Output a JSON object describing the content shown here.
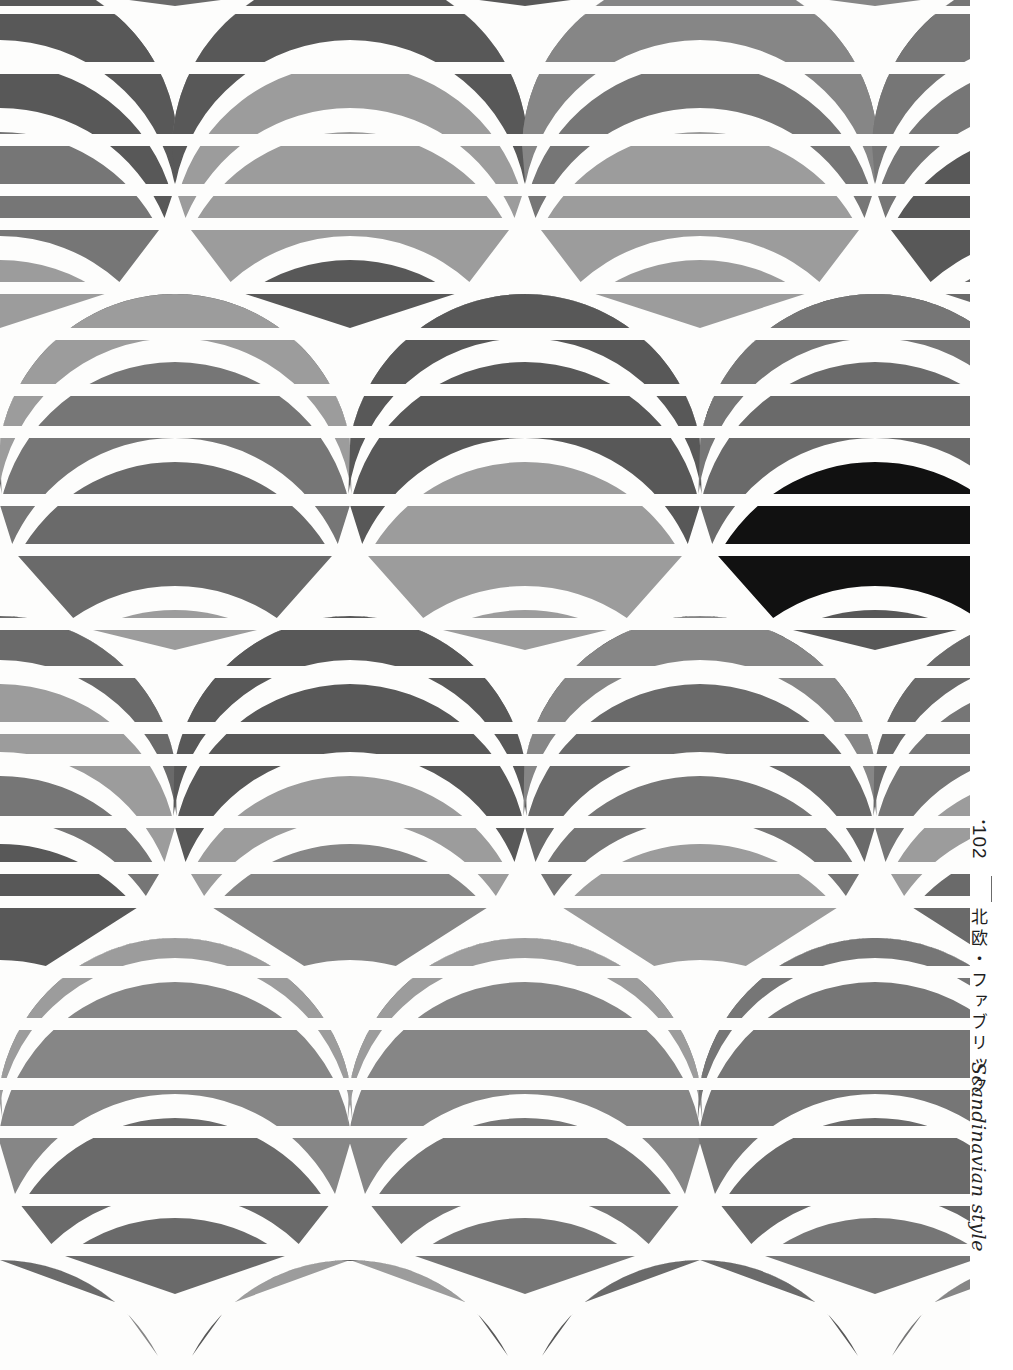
{
  "page": {
    "width": 1013,
    "height": 1370,
    "background": "#ffffff",
    "artwork_width": 970,
    "margin_width": 43
  },
  "margin": {
    "folio_bullet": "•",
    "folio_number": "102",
    "jp_title": "北欧・ファブリック",
    "en_title": "Scandinavian style",
    "rule_color": "#6b6b6b"
  },
  "palette": {
    "white": "#fdfdfc",
    "paper": "#ffffff",
    "light_gray": "#9c9c9c",
    "mid_gray": "#868686",
    "medium_gray": "#767676",
    "dark_gray": "#6a6a6a",
    "darkest_gray": "#585858",
    "black": "#111111"
  },
  "pattern": {
    "name": "striped-circle-lattice",
    "description": "Staggered overlapping circles clipped by horizontal stripe bands",
    "circle_radius": 178,
    "column_x": [
      0,
      350,
      700,
      1050
    ],
    "column_offset_x": 175,
    "row_pitch": 322,
    "stripe_bands": [
      {
        "y": 0,
        "h": 6,
        "color": "#767676"
      },
      {
        "y": 14,
        "h": 48,
        "color": "#585858"
      },
      {
        "y": 74,
        "h": 60,
        "color": "#767676"
      },
      {
        "y": 146,
        "h": 38,
        "color": "#9c9c9c"
      },
      {
        "y": 196,
        "h": 22,
        "color": "#111111"
      },
      {
        "y": 230,
        "h": 52,
        "color": "#868686"
      },
      {
        "y": 294,
        "h": 34,
        "color": "#767676"
      },
      {
        "y": 340,
        "h": 44,
        "color": "#9c9c9c"
      },
      {
        "y": 396,
        "h": 30,
        "color": "#585858"
      },
      {
        "y": 438,
        "h": 56,
        "color": "#767676"
      },
      {
        "y": 506,
        "h": 38,
        "color": "#868686"
      },
      {
        "y": 556,
        "h": 62,
        "color": "#585858"
      },
      {
        "y": 630,
        "h": 36,
        "color": "#767676"
      },
      {
        "y": 678,
        "h": 44,
        "color": "#9c9c9c"
      },
      {
        "y": 734,
        "h": 20,
        "color": "#111111"
      },
      {
        "y": 766,
        "h": 50,
        "color": "#868686"
      },
      {
        "y": 828,
        "h": 34,
        "color": "#767676"
      },
      {
        "y": 874,
        "h": 22,
        "color": "#111111"
      },
      {
        "y": 908,
        "h": 58,
        "color": "#9c9c9c"
      },
      {
        "y": 978,
        "h": 40,
        "color": "#767676"
      },
      {
        "y": 1030,
        "h": 48,
        "color": "#868686"
      },
      {
        "y": 1090,
        "h": 36,
        "color": "#9c9c9c"
      },
      {
        "y": 1138,
        "h": 56,
        "color": "#6a6a6a"
      },
      {
        "y": 1206,
        "h": 38,
        "color": "#868686"
      },
      {
        "y": 1256,
        "h": 46,
        "color": "#767676"
      },
      {
        "y": 1314,
        "h": 42,
        "color": "#6a6a6a"
      }
    ]
  }
}
